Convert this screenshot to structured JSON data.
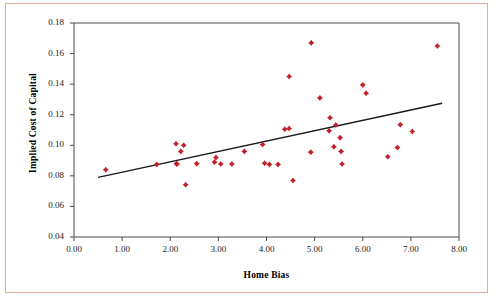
{
  "chart_data": {
    "type": "scatter",
    "title": "",
    "xlabel": "Home Bias",
    "ylabel": "Implied Cost of Capital",
    "xlim": [
      0.0,
      8.0
    ],
    "ylim": [
      0.04,
      0.18
    ],
    "xticks": [
      "0.00",
      "1.00",
      "2.00",
      "3.00",
      "4.00",
      "5.00",
      "6.00",
      "7.00",
      "8.00"
    ],
    "yticks": [
      "0.04",
      "0.06",
      "0.08",
      "0.10",
      "0.12",
      "0.14",
      "0.16",
      "0.18"
    ],
    "grid": false,
    "legend": "none",
    "marker_color": "#c0202a",
    "trendline_color": "#1a1a1a",
    "series": [
      {
        "name": "Countries",
        "points": [
          [
            0.66,
            0.084
          ],
          [
            1.72,
            0.0875
          ],
          [
            2.12,
            0.101
          ],
          [
            2.28,
            0.1
          ],
          [
            2.22,
            0.096
          ],
          [
            2.13,
            0.088
          ],
          [
            2.14,
            0.0877
          ],
          [
            2.32,
            0.0742
          ],
          [
            2.55,
            0.088
          ],
          [
            2.92,
            0.089
          ],
          [
            2.95,
            0.092
          ],
          [
            3.05,
            0.0878
          ],
          [
            3.28,
            0.0878
          ],
          [
            3.54,
            0.096
          ],
          [
            3.92,
            0.1005
          ],
          [
            3.96,
            0.0882
          ],
          [
            4.06,
            0.0875
          ],
          [
            4.24,
            0.0875
          ],
          [
            4.38,
            0.1105
          ],
          [
            4.47,
            0.111
          ],
          [
            4.47,
            0.145
          ],
          [
            4.55,
            0.077
          ],
          [
            4.93,
            0.167
          ],
          [
            4.92,
            0.0955
          ],
          [
            5.11,
            0.131
          ],
          [
            5.3,
            0.1095
          ],
          [
            5.32,
            0.118
          ],
          [
            5.44,
            0.1133
          ],
          [
            5.4,
            0.099
          ],
          [
            5.53,
            0.105
          ],
          [
            5.55,
            0.096
          ],
          [
            5.57,
            0.0878
          ],
          [
            6.0,
            0.1395
          ],
          [
            6.07,
            0.134
          ],
          [
            6.52,
            0.0925
          ],
          [
            6.72,
            0.0985
          ],
          [
            6.78,
            0.1135
          ],
          [
            7.03,
            0.109
          ],
          [
            7.55,
            0.165
          ]
        ]
      }
    ],
    "trendline": {
      "x": [
        0.5,
        7.65
      ],
      "y": [
        0.079,
        0.1275
      ]
    }
  }
}
